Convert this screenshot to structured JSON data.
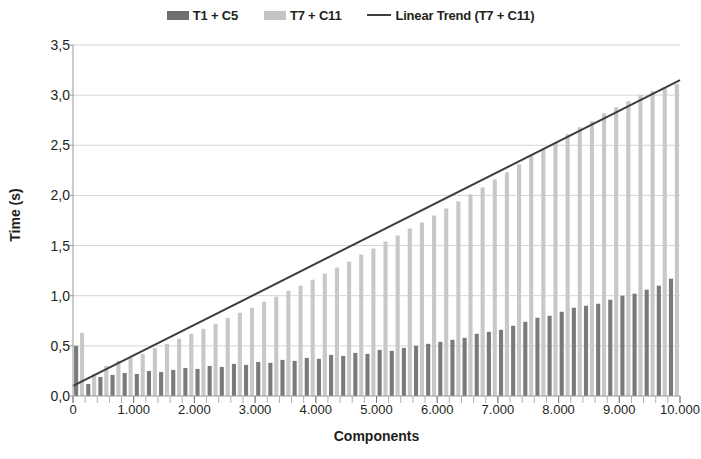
{
  "legend": {
    "entries": [
      {
        "label": "T1 + C5",
        "type": "swatch",
        "color": "#6f6f6f",
        "name": "legend-t1-c5"
      },
      {
        "label": "T7 + C11",
        "type": "swatch",
        "color": "#c4c4c4",
        "name": "legend-t7-c11"
      },
      {
        "label": "Linear Trend (T7 + C11)",
        "type": "line",
        "color": "#3d3d3d",
        "name": "legend-linear-trend"
      }
    ]
  },
  "axes": {
    "y_title": "Time (s)",
    "x_title": "Components",
    "y_ticks": [
      "0,0",
      "0,5",
      "1,0",
      "1,5",
      "2,0",
      "2,5",
      "3,0",
      "3,5"
    ],
    "x_ticks": [
      "0",
      "1.000",
      "2.000",
      "3.000",
      "4.000",
      "5.000",
      "6.000",
      "7.000",
      "8.000",
      "9.000",
      "10.000"
    ]
  },
  "chart_data": {
    "type": "bar",
    "title": "",
    "xlabel": "Components",
    "ylabel": "Time (s)",
    "xlim": [
      0,
      10000
    ],
    "ylim": [
      0,
      3.5
    ],
    "ytick_values": [
      0.0,
      0.5,
      1.0,
      1.5,
      2.0,
      2.5,
      3.0,
      3.5
    ],
    "xtick_values": [
      0,
      1000,
      2000,
      3000,
      4000,
      5000,
      6000,
      7000,
      8000,
      9000,
      10000
    ],
    "grid": "horizontal",
    "legend_position": "top-center",
    "x": [
      100,
      300,
      500,
      700,
      900,
      1100,
      1300,
      1500,
      1700,
      1900,
      2100,
      2300,
      2500,
      2700,
      2900,
      3100,
      3300,
      3500,
      3700,
      3900,
      4100,
      4300,
      4500,
      4700,
      4900,
      5100,
      5300,
      5500,
      5700,
      5900,
      6100,
      6300,
      6500,
      6700,
      6900,
      7100,
      7300,
      7500,
      7700,
      7900,
      8100,
      8300,
      8500,
      8700,
      8900,
      9100,
      9300,
      9500,
      9700,
      9900
    ],
    "series": [
      {
        "name": "T1 + C5",
        "color": "#7a7a7a",
        "values": [
          0.5,
          0.12,
          0.19,
          0.21,
          0.23,
          0.22,
          0.25,
          0.24,
          0.26,
          0.28,
          0.27,
          0.3,
          0.29,
          0.32,
          0.31,
          0.34,
          0.33,
          0.36,
          0.35,
          0.38,
          0.37,
          0.41,
          0.4,
          0.43,
          0.42,
          0.46,
          0.45,
          0.48,
          0.5,
          0.52,
          0.54,
          0.56,
          0.58,
          0.62,
          0.64,
          0.66,
          0.7,
          0.74,
          0.78,
          0.8,
          0.84,
          0.88,
          0.9,
          0.92,
          0.96,
          1.0,
          1.02,
          1.06,
          1.1,
          1.17
        ]
      },
      {
        "name": "T7 + C11",
        "color": "#c8c8c8",
        "values": [
          0.63,
          0.22,
          0.3,
          0.35,
          0.38,
          0.42,
          0.48,
          0.52,
          0.57,
          0.62,
          0.67,
          0.72,
          0.78,
          0.83,
          0.88,
          0.94,
          0.99,
          1.05,
          1.1,
          1.16,
          1.22,
          1.28,
          1.34,
          1.41,
          1.47,
          1.54,
          1.6,
          1.67,
          1.73,
          1.8,
          1.87,
          1.94,
          2.01,
          2.08,
          2.16,
          2.23,
          2.31,
          2.4,
          2.46,
          2.53,
          2.61,
          2.68,
          2.74,
          2.82,
          2.88,
          2.94,
          3.0,
          3.04,
          3.08,
          3.11
        ]
      }
    ],
    "trend": {
      "name": "Linear Trend (T7 + C11)",
      "color": "#3d3d3d",
      "x": [
        0,
        10000
      ],
      "y": [
        0.1,
        3.15
      ]
    }
  }
}
